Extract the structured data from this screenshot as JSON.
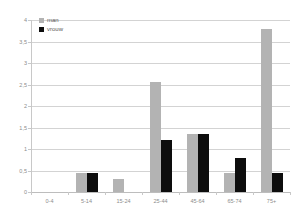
{
  "chart_data": {
    "type": "bar",
    "title": "",
    "xlabel": "",
    "ylabel": "",
    "categories": [
      "0-4",
      "5-14",
      "15-24",
      "25-44",
      "45-64",
      "65-74",
      "75+"
    ],
    "series": [
      {
        "name": "man",
        "color": "#b3b3b3",
        "values": [
          0,
          0.45,
          0.3,
          2.55,
          1.35,
          0.45,
          3.8
        ]
      },
      {
        "name": "vrouw",
        "color": "#0d0d0d",
        "values": [
          0,
          0.45,
          0,
          1.2,
          1.35,
          0.8,
          0.45
        ]
      }
    ],
    "ylim": [
      0,
      4
    ],
    "ytick_step": 0.5,
    "ytick_labels": [
      "4",
      "3,5",
      "3",
      "2,5",
      "2",
      "1,5",
      "1",
      "0,5",
      "0"
    ],
    "ytick_values": [
      4,
      3.5,
      3,
      2.5,
      2,
      1.5,
      1,
      0.5,
      0
    ],
    "grid": true,
    "legend_position": "top-left"
  },
  "legend": {
    "items": [
      {
        "label": "man"
      },
      {
        "label": "vrouw"
      }
    ]
  },
  "colors": {
    "man": "#b3b3b3",
    "vrouw": "#0d0d0d",
    "grid": "#d3d3d3",
    "axis": "#c8c8c8",
    "tick_text": "#8c8c8c",
    "background": "#ffffff"
  }
}
